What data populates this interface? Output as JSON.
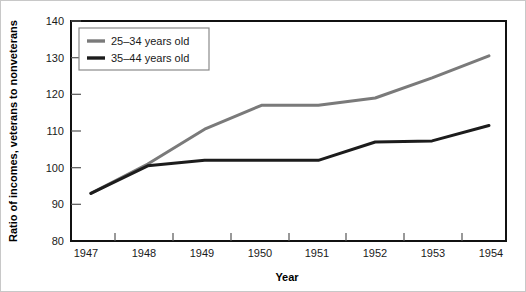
{
  "chart_data": {
    "type": "line",
    "title": "",
    "xlabel": "Year",
    "ylabel": "Ratio of incomes, veterans to nonveterans",
    "x": [
      1947,
      1948,
      1949,
      1950,
      1951,
      1952,
      1953,
      1954
    ],
    "xtick_labels": [
      "1947",
      "1948",
      "1949",
      "1950",
      "1951",
      "1952",
      "1953",
      "1954"
    ],
    "ytick_labels": [
      "80",
      "90",
      "100",
      "110",
      "120",
      "130",
      "140"
    ],
    "yticks": [
      80,
      90,
      100,
      110,
      120,
      130,
      140
    ],
    "ylim": [
      80,
      140
    ],
    "xlim": [
      1946.65,
      1954.3
    ],
    "grid": false,
    "legend_position": "top-left",
    "series": [
      {
        "name": "25–34 years old",
        "color": "#7a7a7a",
        "values": [
          93,
          101,
          110.5,
          117,
          117,
          119,
          124.5,
          130.5
        ]
      },
      {
        "name": "35–44 years old",
        "color": "#1c1c1c",
        "values": [
          93,
          100.5,
          102,
          102,
          102,
          107,
          107.3,
          111.5
        ]
      }
    ]
  },
  "legend": {
    "entries": [
      {
        "label": "25–34 years old"
      },
      {
        "label": "35–44 years old"
      }
    ]
  },
  "axes": {
    "x_title": "Year",
    "y_title": "Ratio of incomes, veterans to nonveterans"
  },
  "colors": {
    "series_1": "#7a7a7a",
    "series_2": "#1c1c1c",
    "frame": "#111111",
    "background": "#ffffff"
  }
}
